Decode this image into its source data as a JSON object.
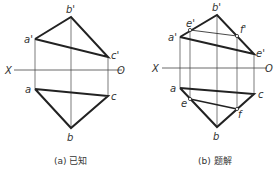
{
  "figures": [
    {
      "id": "a",
      "caption": "(a) 已知",
      "axis": {
        "left_label": "X",
        "right_label": "O"
      },
      "points": {
        "b_prime": {
          "label": "b'",
          "x": 71,
          "y": 17
        },
        "a_prime": {
          "label": "a'",
          "x": 35,
          "y": 39
        },
        "c_prime": {
          "label": "c'",
          "x": 108,
          "y": 57
        },
        "a": {
          "label": "a",
          "x": 35,
          "y": 89
        },
        "c": {
          "label": "c",
          "x": 108,
          "y": 96
        },
        "b": {
          "label": "b",
          "x": 71,
          "y": 128
        }
      }
    },
    {
      "id": "b",
      "caption": "(b) 题解",
      "axis": {
        "left_label": "X",
        "right_label": "O"
      },
      "points": {
        "b_prime": {
          "label": "b'",
          "x": 217,
          "y": 15
        },
        "e_prime": {
          "label": "e'",
          "x": 190,
          "y": 30
        },
        "a_prime": {
          "label": "a'",
          "x": 180,
          "y": 37
        },
        "f_prime": {
          "label": "f'",
          "x": 237,
          "y": 36
        },
        "c_prime": {
          "label": "e'",
          "x": 254,
          "y": 54
        },
        "a": {
          "label": "a",
          "x": 180,
          "y": 88
        },
        "c": {
          "label": "c",
          "x": 254,
          "y": 94
        },
        "e": {
          "label": "e",
          "x": 190,
          "y": 99
        },
        "f": {
          "label": "f",
          "x": 237,
          "y": 109
        },
        "b": {
          "label": "b",
          "x": 217,
          "y": 127
        }
      }
    }
  ],
  "colors": {
    "line": "#222222",
    "thin": "#444444",
    "text": "#333333"
  }
}
